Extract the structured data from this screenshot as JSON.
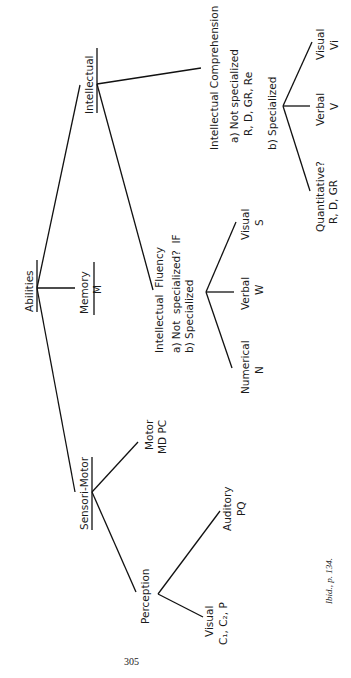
{
  "diagram": {
    "orientation": "rotated-90-ccw",
    "root": {
      "label": "Abilities",
      "underlined": true,
      "children": [
        {
          "label": "Intellectual",
          "underlined": true,
          "children": [
            {
              "label": "Intellectual Comprehension",
              "not_specialized": "a) Not specialized",
              "not_specialized_codes": "R, D, GR, Re",
              "specialized": "b) Specialized",
              "specialized_children": [
                {
                  "label": "Quantitative?",
                  "code": "R, D, GR"
                },
                {
                  "label": "Verbal",
                  "code": "V"
                },
                {
                  "label": "Visual",
                  "code": "Vi"
                }
              ]
            },
            {
              "label": "Intellectual  Fluency",
              "not_specialized": "a) Not  specialized?  IF",
              "specialized": "b) Specialized",
              "specialized_children": [
                {
                  "label": "Numerical",
                  "code": "N"
                },
                {
                  "label": "Verbal",
                  "code": "W"
                },
                {
                  "label": "Visual",
                  "code": "S"
                }
              ]
            }
          ]
        },
        {
          "label": "Memory",
          "code": "M",
          "underlined": true
        },
        {
          "label": "Sensori-Motor",
          "underlined": true,
          "children": [
            {
              "label": "Motor",
              "code": "MD PC"
            },
            {
              "label": "Perception",
              "children": [
                {
                  "label": "Auditory",
                  "code": "PQ"
                },
                {
                  "label": "Visual",
                  "code": "C₁, C₂, P"
                }
              ]
            }
          ]
        }
      ]
    }
  },
  "footnote": "Ibid., p. 134.",
  "page_number": "305"
}
